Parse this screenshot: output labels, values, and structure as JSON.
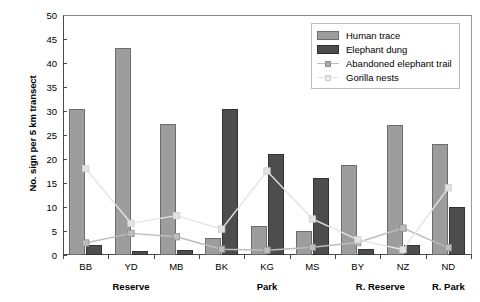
{
  "chart_data": {
    "type": "bar",
    "title": "",
    "xlabel": "",
    "ylabel": "No. sign per 5 km transect",
    "ylim": [
      0,
      50
    ],
    "ytick_step": 5,
    "yticks": [
      0,
      5,
      10,
      15,
      20,
      25,
      30,
      35,
      40,
      45,
      50
    ],
    "grid": false,
    "legend_position": "top-right",
    "categories": [
      "BB",
      "YD",
      "MB",
      "BK",
      "KG",
      "MS",
      "BY",
      "NZ",
      "ND"
    ],
    "groups": [
      {
        "label": "Reserve",
        "categories": [
          "BB",
          "YD",
          "MB"
        ]
      },
      {
        "label": "Park",
        "categories": [
          "BK",
          "KG",
          "MS"
        ]
      },
      {
        "label": "R. Reserve",
        "categories": [
          "BY",
          "NZ"
        ]
      },
      {
        "label": "R. Park",
        "categories": [
          "ND"
        ]
      }
    ],
    "series": [
      {
        "name": "Human trace",
        "kind": "bar",
        "color": "#9d9d9d",
        "values": [
          30.4,
          43.2,
          27.2,
          3.5,
          6.0,
          5.0,
          18.7,
          27.0,
          23.2
        ]
      },
      {
        "name": "Elephant dung",
        "kind": "bar",
        "color": "#4d4d4d",
        "values": [
          2.0,
          0.8,
          1.0,
          30.5,
          21.0,
          16.0,
          1.3,
          2.0,
          10.0
        ]
      },
      {
        "name": "Abandoned elephant trail",
        "kind": "line",
        "color": "#bdbdbd",
        "values": [
          2.5,
          4.5,
          3.8,
          1.2,
          1.0,
          1.6,
          2.6,
          5.6,
          1.5
        ]
      },
      {
        "name": "Gorilla nests",
        "kind": "line",
        "color": "#e4e4e4",
        "values": [
          18.0,
          6.6,
          8.2,
          5.4,
          17.5,
          7.5,
          3.2,
          1.1,
          14.0
        ]
      }
    ]
  }
}
